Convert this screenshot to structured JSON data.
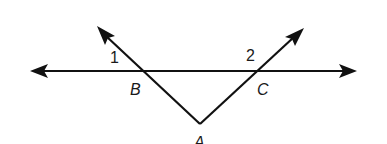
{
  "diagram": {
    "type": "geometry",
    "colors": {
      "stroke": "#111111",
      "background": "#ffffff"
    },
    "points": {
      "A": {
        "label": "A",
        "x": 200,
        "y": 124
      },
      "B": {
        "label": "B",
        "x": 145,
        "y": 71
      },
      "C": {
        "label": "C",
        "x": 256,
        "y": 71
      }
    },
    "angles": [
      {
        "label": "1",
        "vertex": "B",
        "position": "above-left of B"
      },
      {
        "label": "2",
        "vertex": "C",
        "position": "above-left of C"
      }
    ],
    "lines": [
      {
        "name": "horizontal-line",
        "through": [
          "B",
          "C"
        ],
        "arrows": "both"
      },
      {
        "name": "ray-AB",
        "from": "A",
        "through": "B",
        "arrows": "end"
      },
      {
        "name": "ray-AC",
        "from": "A",
        "through": "C",
        "arrows": "end"
      }
    ]
  }
}
